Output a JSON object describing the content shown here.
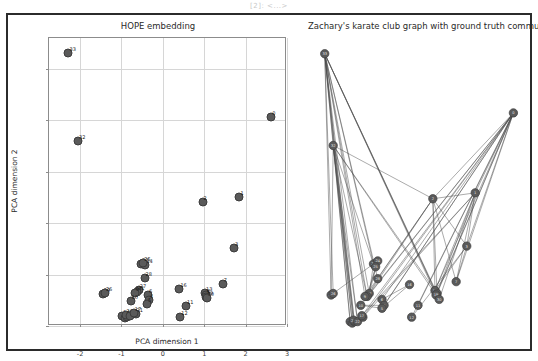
{
  "notebook": {
    "output_label": "[2]: <...>"
  },
  "figure": {
    "border_color": "#2b2b2b",
    "background": "#ffffff",
    "node_color": "#5a5a5a",
    "edge_color": "#4a4a4a",
    "grid_color": "#d6d6d6"
  },
  "left_panel": {
    "title": "HOPE embedding",
    "xlabel": "PCA dimension 1",
    "ylabel": "PCA dimension 2"
  },
  "right_panel": {
    "title": "Zachary's karate club graph with ground truth communities"
  },
  "chart_data": [
    {
      "type": "scatter",
      "title": "HOPE embedding",
      "xlabel": "PCA dimension 1",
      "ylabel": "PCA dimension 2",
      "xlim": [
        -2.75,
        3.0
      ],
      "ylim": [
        -1.0,
        4.6
      ],
      "xticks": [
        -2,
        -1,
        0,
        1,
        2,
        3
      ],
      "yticks": [
        -1,
        0,
        1,
        2,
        3,
        4
      ],
      "grid": true,
      "legend": "none",
      "point_labels_shown": true,
      "points": [
        {
          "label": "33",
          "x": -2.28,
          "y": 4.3
        },
        {
          "label": "32",
          "x": -2.05,
          "y": 2.6
        },
        {
          "label": "0",
          "x": 2.62,
          "y": 3.06
        },
        {
          "label": "1",
          "x": 1.85,
          "y": 1.5
        },
        {
          "label": "2",
          "x": 0.96,
          "y": 1.42
        },
        {
          "label": "3",
          "x": 1.72,
          "y": 0.52
        },
        {
          "label": "7",
          "x": 1.45,
          "y": -0.18
        },
        {
          "label": "13",
          "x": 1.02,
          "y": -0.36
        },
        {
          "label": "8",
          "x": 1.05,
          "y": -0.4
        },
        {
          "label": "19",
          "x": 1.04,
          "y": -0.43
        },
        {
          "label": "30",
          "x": 1.06,
          "y": -0.46
        },
        {
          "label": "16",
          "x": 0.4,
          "y": -0.28
        },
        {
          "label": "11",
          "x": 0.56,
          "y": -0.62
        },
        {
          "label": "12",
          "x": 0.42,
          "y": -0.82
        },
        {
          "label": "23",
          "x": -0.52,
          "y": 0.21
        },
        {
          "label": "24",
          "x": -0.42,
          "y": 0.18
        },
        {
          "label": "25",
          "x": -0.47,
          "y": 0.23
        },
        {
          "label": "28",
          "x": -0.44,
          "y": -0.06
        },
        {
          "label": "27",
          "x": -0.58,
          "y": -0.3
        },
        {
          "label": "31",
          "x": -0.62,
          "y": -0.33
        },
        {
          "label": "9",
          "x": -0.68,
          "y": -0.36
        },
        {
          "label": "6",
          "x": -0.36,
          "y": -0.4
        },
        {
          "label": "4",
          "x": -0.34,
          "y": -0.5
        },
        {
          "label": "5",
          "x": -0.38,
          "y": -0.58
        },
        {
          "label": "10",
          "x": -0.78,
          "y": -0.52
        },
        {
          "label": "29",
          "x": -1.45,
          "y": -0.38
        },
        {
          "label": "26",
          "x": -1.4,
          "y": -0.36
        },
        {
          "label": "14",
          "x": -0.98,
          "y": -0.8
        },
        {
          "label": "15",
          "x": -0.92,
          "y": -0.84
        },
        {
          "label": "18",
          "x": -0.86,
          "y": -0.82
        },
        {
          "label": "20",
          "x": -0.9,
          "y": -0.78
        },
        {
          "label": "22",
          "x": -0.8,
          "y": -0.8
        },
        {
          "label": "21",
          "x": -0.66,
          "y": -0.76
        },
        {
          "label": "17",
          "x": -0.7,
          "y": -0.74
        }
      ]
    },
    {
      "type": "graph",
      "title": "Zachary's karate club graph with ground truth communities",
      "layout": "embedding-positions",
      "node_count": 34,
      "nodes": [
        {
          "id": "33",
          "x": 0.06,
          "y": 0.07
        },
        {
          "id": "32",
          "x": 0.1,
          "y": 0.38
        },
        {
          "id": "0",
          "x": 0.95,
          "y": 0.27
        },
        {
          "id": "1",
          "x": 0.77,
          "y": 0.54
        },
        {
          "id": "2",
          "x": 0.57,
          "y": 0.56
        },
        {
          "id": "3",
          "x": 0.73,
          "y": 0.72
        },
        {
          "id": "7",
          "x": 0.68,
          "y": 0.84
        },
        {
          "id": "13",
          "x": 0.58,
          "y": 0.87
        },
        {
          "id": "8",
          "x": 0.59,
          "y": 0.88
        },
        {
          "id": "19",
          "x": 0.585,
          "y": 0.885
        },
        {
          "id": "30",
          "x": 0.6,
          "y": 0.9
        },
        {
          "id": "16",
          "x": 0.46,
          "y": 0.85
        },
        {
          "id": "11",
          "x": 0.5,
          "y": 0.92
        },
        {
          "id": "12",
          "x": 0.47,
          "y": 0.96
        },
        {
          "id": "23",
          "x": 0.29,
          "y": 0.78
        },
        {
          "id": "24",
          "x": 0.31,
          "y": 0.77
        },
        {
          "id": "25",
          "x": 0.3,
          "y": 0.79
        },
        {
          "id": "28",
          "x": 0.31,
          "y": 0.83
        },
        {
          "id": "27",
          "x": 0.27,
          "y": 0.88
        },
        {
          "id": "31",
          "x": 0.26,
          "y": 0.89
        },
        {
          "id": "9",
          "x": 0.25,
          "y": 0.89
        },
        {
          "id": "6",
          "x": 0.33,
          "y": 0.9
        },
        {
          "id": "4",
          "x": 0.34,
          "y": 0.92
        },
        {
          "id": "5",
          "x": 0.33,
          "y": 0.93
        },
        {
          "id": "10",
          "x": 0.23,
          "y": 0.92
        },
        {
          "id": "29",
          "x": 0.09,
          "y": 0.885
        },
        {
          "id": "26",
          "x": 0.1,
          "y": 0.88
        },
        {
          "id": "14",
          "x": 0.18,
          "y": 0.975
        },
        {
          "id": "15",
          "x": 0.19,
          "y": 0.98
        },
        {
          "id": "18",
          "x": 0.2,
          "y": 0.975
        },
        {
          "id": "20",
          "x": 0.195,
          "y": 0.97
        },
        {
          "id": "22",
          "x": 0.215,
          "y": 0.975
        },
        {
          "id": "21",
          "x": 0.24,
          "y": 0.96
        },
        {
          "id": "17",
          "x": 0.235,
          "y": 0.955
        }
      ],
      "edges": [
        [
          "0",
          "1"
        ],
        [
          "0",
          "2"
        ],
        [
          "0",
          "3"
        ],
        [
          "0",
          "4"
        ],
        [
          "0",
          "5"
        ],
        [
          "0",
          "6"
        ],
        [
          "0",
          "7"
        ],
        [
          "0",
          "8"
        ],
        [
          "0",
          "10"
        ],
        [
          "0",
          "11"
        ],
        [
          "0",
          "12"
        ],
        [
          "0",
          "13"
        ],
        [
          "0",
          "17"
        ],
        [
          "0",
          "19"
        ],
        [
          "0",
          "21"
        ],
        [
          "0",
          "31"
        ],
        [
          "1",
          "2"
        ],
        [
          "1",
          "3"
        ],
        [
          "1",
          "7"
        ],
        [
          "1",
          "13"
        ],
        [
          "1",
          "17"
        ],
        [
          "1",
          "19"
        ],
        [
          "1",
          "21"
        ],
        [
          "1",
          "30"
        ],
        [
          "2",
          "3"
        ],
        [
          "2",
          "7"
        ],
        [
          "2",
          "8"
        ],
        [
          "2",
          "9"
        ],
        [
          "2",
          "13"
        ],
        [
          "2",
          "27"
        ],
        [
          "2",
          "28"
        ],
        [
          "2",
          "32"
        ],
        [
          "3",
          "7"
        ],
        [
          "3",
          "12"
        ],
        [
          "3",
          "13"
        ],
        [
          "4",
          "6"
        ],
        [
          "4",
          "10"
        ],
        [
          "5",
          "6"
        ],
        [
          "5",
          "10"
        ],
        [
          "5",
          "16"
        ],
        [
          "6",
          "16"
        ],
        [
          "8",
          "30"
        ],
        [
          "8",
          "32"
        ],
        [
          "8",
          "33"
        ],
        [
          "9",
          "33"
        ],
        [
          "13",
          "33"
        ],
        [
          "14",
          "32"
        ],
        [
          "14",
          "33"
        ],
        [
          "15",
          "32"
        ],
        [
          "15",
          "33"
        ],
        [
          "18",
          "32"
        ],
        [
          "18",
          "33"
        ],
        [
          "19",
          "33"
        ],
        [
          "20",
          "32"
        ],
        [
          "20",
          "33"
        ],
        [
          "22",
          "32"
        ],
        [
          "22",
          "33"
        ],
        [
          "23",
          "25"
        ],
        [
          "23",
          "27"
        ],
        [
          "23",
          "29"
        ],
        [
          "23",
          "32"
        ],
        [
          "23",
          "33"
        ],
        [
          "24",
          "25"
        ],
        [
          "24",
          "27"
        ],
        [
          "24",
          "31"
        ],
        [
          "25",
          "31"
        ],
        [
          "26",
          "29"
        ],
        [
          "26",
          "33"
        ],
        [
          "27",
          "33"
        ],
        [
          "28",
          "31"
        ],
        [
          "28",
          "33"
        ],
        [
          "29",
          "32"
        ],
        [
          "29",
          "33"
        ],
        [
          "30",
          "32"
        ],
        [
          "30",
          "33"
        ],
        [
          "31",
          "32"
        ],
        [
          "31",
          "33"
        ],
        [
          "32",
          "33"
        ]
      ]
    }
  ]
}
